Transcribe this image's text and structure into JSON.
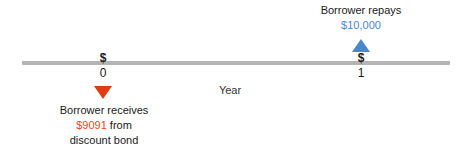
{
  "diagram": {
    "axis": {
      "caption": "Year",
      "ticks": [
        {
          "marker": "$",
          "label": "0"
        },
        {
          "marker": "$",
          "label": "1"
        }
      ]
    },
    "annotations": {
      "repays": {
        "line1": "Borrower repays",
        "amount": "$10,000",
        "arrow": "triangle-up-icon"
      },
      "receives": {
        "line1": "Borrower receives",
        "amount": "$9091",
        "line2_suffix": " from",
        "line3": "discount bond",
        "arrow": "triangle-down-icon"
      }
    },
    "colors": {
      "axis": "#b4b4b4",
      "inflow_red": "#e8491e",
      "outflow_blue": "#4a88cc",
      "text": "#1a1a1a",
      "background": "#ffffff"
    }
  }
}
